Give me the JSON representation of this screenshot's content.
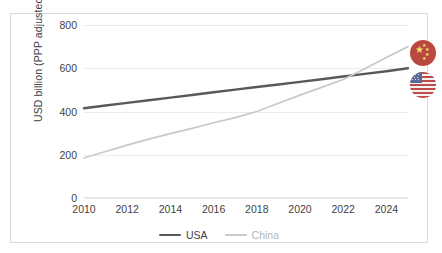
{
  "chart_data": {
    "type": "line",
    "title": "",
    "xlabel": "",
    "ylabel": "USD billion (PPP adjusted)",
    "x": [
      2010,
      2011,
      2012,
      2013,
      2014,
      2015,
      2016,
      2017,
      2018,
      2019,
      2020,
      2021,
      2022,
      2023,
      2024,
      2025
    ],
    "xlim": [
      2010,
      2025
    ],
    "ylim": [
      0,
      800
    ],
    "xticks": [
      2010,
      2012,
      2014,
      2016,
      2018,
      2020,
      2022,
      2024
    ],
    "xtick_labels": [
      "2010",
      "2012",
      "2014",
      "2016",
      "2018",
      "2020",
      "2022",
      "2024"
    ],
    "yticks": [
      0,
      200,
      400,
      600,
      800
    ],
    "ytick_labels": [
      "0",
      "200",
      "400",
      "600",
      "800"
    ],
    "grid": true,
    "legend_position": "bottom",
    "series": [
      {
        "name": "USA",
        "color": "#595959",
        "values": [
          415,
          428,
          440,
          452,
          464,
          476,
          489,
          501,
          513,
          525,
          537,
          549,
          562,
          574,
          586,
          600
        ]
      },
      {
        "name": "China",
        "color": "#c9c9c9",
        "values": [
          185,
          215,
          245,
          272,
          298,
          322,
          348,
          372,
          400,
          438,
          476,
          512,
          548,
          598,
          650,
          700
        ]
      }
    ],
    "annotations": [
      {
        "name": "china-flag-badge",
        "label": "China flag",
        "value": 700
      },
      {
        "name": "usa-flag-badge",
        "label": "USA flag",
        "value": 600
      }
    ]
  },
  "legend": {
    "items": [
      {
        "label": "USA",
        "color": "#595959"
      },
      {
        "label": "China",
        "color": "#c9c9c9"
      }
    ]
  },
  "icons": {
    "china_flag": "china-flag-icon",
    "usa_flag": "usa-flag-icon"
  }
}
